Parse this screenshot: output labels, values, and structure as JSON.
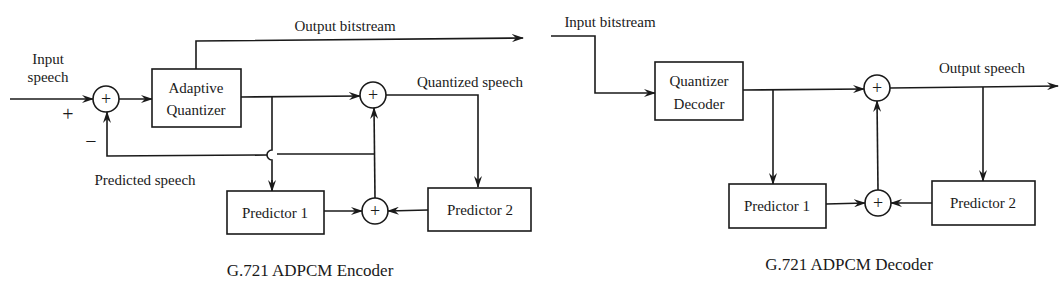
{
  "encoder": {
    "caption": "G.721 ADPCM Encoder",
    "input_label_line1": "Input",
    "input_label_line2": "speech",
    "plus_sign": "+",
    "minus_sign": "−",
    "adaptive_quantizer_line1": "Adaptive",
    "adaptive_quantizer_line2": "Quantizer",
    "output_bitstream_label": "Output bitstream",
    "quantized_speech_label": "Quantized speech",
    "predicted_speech_label": "Predicted speech",
    "predictor1_label": "Predictor 1",
    "predictor2_label": "Predictor 2",
    "sum_symbol": "+"
  },
  "decoder": {
    "caption": "G.721 ADPCM Decoder",
    "input_bitstream_label": "Input bitstream",
    "quantizer_decoder_line1": "Quantizer",
    "quantizer_decoder_line2": "Decoder",
    "output_speech_label": "Output speech",
    "predictor1_label": "Predictor 1",
    "predictor2_label": "Predictor 2",
    "sum_symbol": "+"
  },
  "colors": {
    "line": "#1a1a1a",
    "background": "#ffffff"
  }
}
